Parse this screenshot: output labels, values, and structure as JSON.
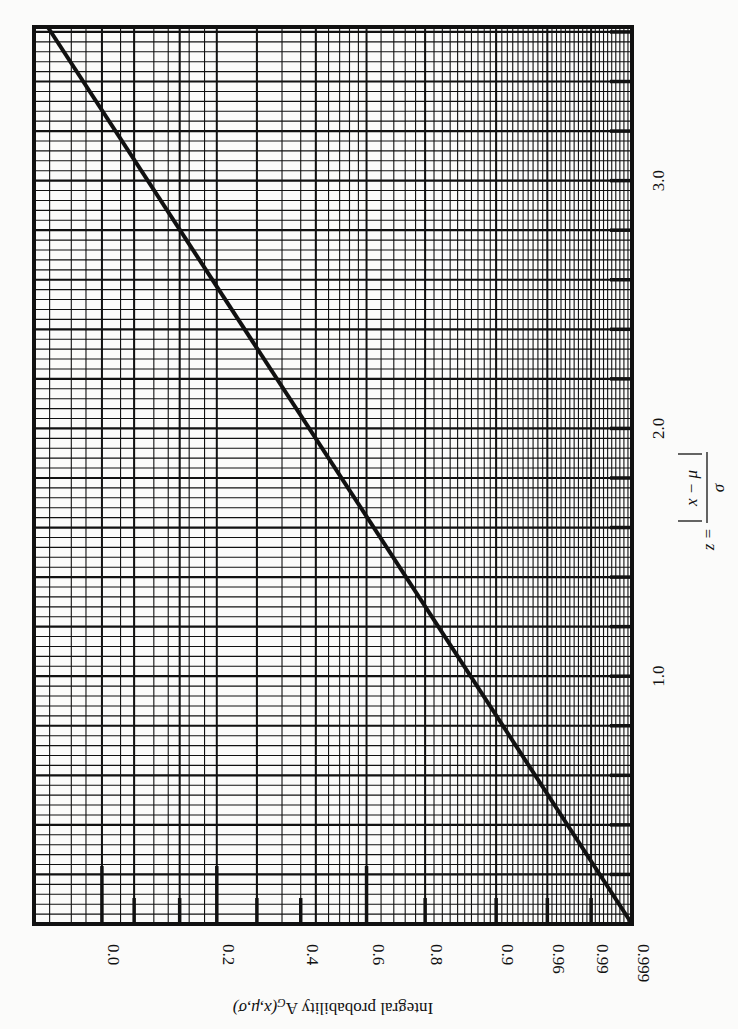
{
  "chart_data": {
    "type": "line",
    "title": "",
    "orientation_note": "figure rotated 90 degrees; probability axis runs along bottom edge (right-to-left), z axis runs along right edge (bottom-to-top)",
    "xlabel": "z = |x − μ| / σ",
    "ylabel": "Integral probability A_G(x,μ,σ)",
    "xlim": [
      0,
      3.6
    ],
    "ylim": [
      0.0,
      0.9998
    ],
    "x_ticks": [
      "1.0",
      "2.0",
      "3.0"
    ],
    "x_tick_values": [
      1.0,
      2.0,
      3.0
    ],
    "x_minor_tick_step": 0.2,
    "y_ticks": [
      "0.0",
      "0.2",
      "0.4",
      "0.6",
      "0.8",
      "0.9",
      "0.96",
      "0.99",
      "0.999"
    ],
    "y_tick_values": [
      0.0,
      0.2,
      0.4,
      0.6,
      0.8,
      0.9,
      0.96,
      0.99,
      0.999
    ],
    "y_scale": "probability (erf) scale",
    "grid": true,
    "legend": null,
    "series": [
      {
        "name": "A_G vs z",
        "x": [
          0.0,
          0.5,
          1.0,
          1.5,
          2.0,
          2.5,
          3.0,
          3.5
        ],
        "y": [
          0.0,
          0.383,
          0.683,
          0.866,
          0.954,
          0.988,
          0.997,
          0.9995
        ]
      }
    ]
  },
  "labels": {
    "z_ticks": [
      "1.0",
      "2.0",
      "3.0"
    ],
    "z_axis_lhs": "z =",
    "z_axis_num": "x − μ",
    "z_axis_den": "σ",
    "p_ticks": [
      "0.999",
      "0.99",
      "0.96",
      "0.9",
      "0.8",
      "0.6",
      "0.4",
      "0.2",
      "0.0"
    ],
    "p_axis_title": "Integral probability A",
    "p_axis_sub": "G",
    "p_axis_args": "(x,μ,σ)"
  },
  "colors": {
    "ink": "#111111",
    "paper": "#fbfbfa"
  }
}
